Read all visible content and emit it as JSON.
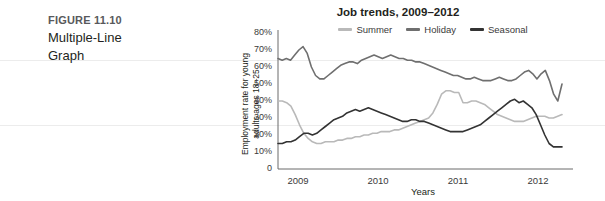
{
  "figure": {
    "number": "FIGURE 11.10",
    "title_line1": "Multiple-Line",
    "title_line2": "Graph"
  },
  "chart_data": {
    "type": "line",
    "title": "Job trends, 2009–2012",
    "xlabel": "Years",
    "ylabel_line1": "Employment rate for young",
    "ylabel_line2": "adults ages 18–25",
    "ylim": [
      0,
      80
    ],
    "ytick_labels": [
      "80%",
      "70%",
      "60%",
      "50%",
      "40%",
      "30%",
      "20%",
      "10%",
      "0"
    ],
    "ytick_values": [
      80,
      70,
      60,
      50,
      40,
      30,
      20,
      10,
      0
    ],
    "xtick_labels": [
      "2009",
      "2010",
      "2011",
      "2012"
    ],
    "xtick_values": [
      2009,
      2010,
      2011,
      2012
    ],
    "xlim": [
      2008.75,
      2012.3
    ],
    "grid": false,
    "legend_position": "top-center",
    "colors": {
      "summer": "#b9b9b9",
      "holiday": "#6f6f6f",
      "seasonal": "#333333",
      "axis": "#6a6a6a",
      "text": "#231f20"
    },
    "series": [
      {
        "name": "Summer",
        "color": "#b9b9b9",
        "values": [
          40,
          40,
          39,
          37,
          32,
          26,
          21,
          18,
          16,
          15,
          15,
          16,
          16,
          16,
          17,
          17,
          18,
          18,
          19,
          19,
          20,
          20,
          21,
          21,
          22,
          22,
          22,
          23,
          23,
          24,
          25,
          26,
          27,
          28,
          29,
          30,
          33,
          38,
          44,
          46,
          46,
          45,
          45,
          39,
          39,
          40,
          40,
          39,
          38,
          36,
          34,
          32,
          31,
          30,
          29,
          28,
          28,
          28,
          29,
          30,
          31,
          31,
          31,
          30,
          30,
          31,
          32
        ]
      },
      {
        "name": "Holiday",
        "color": "#6f6f6f",
        "values": [
          65,
          64,
          65,
          64,
          67,
          70,
          72,
          68,
          60,
          55,
          53,
          53,
          55,
          57,
          59,
          61,
          62,
          63,
          63,
          62,
          64,
          65,
          66,
          67,
          66,
          65,
          66,
          67,
          66,
          65,
          65,
          64,
          64,
          63,
          63,
          62,
          61,
          60,
          59,
          58,
          57,
          56,
          55,
          55,
          54,
          53,
          53,
          54,
          53,
          52,
          52,
          52,
          53,
          54,
          53,
          52,
          52,
          53,
          55,
          57,
          58,
          56,
          53,
          56,
          58,
          52,
          44,
          40,
          50
        ]
      },
      {
        "name": "Seasonal",
        "color": "#333333",
        "values": [
          15,
          15,
          16,
          16,
          17,
          19,
          21,
          21,
          20,
          21,
          23,
          25,
          27,
          29,
          30,
          31,
          33,
          34,
          35,
          34,
          35,
          36,
          35,
          34,
          33,
          32,
          31,
          30,
          29,
          28,
          28,
          29,
          29,
          28,
          28,
          27,
          26,
          25,
          24,
          23,
          22,
          22,
          22,
          22,
          23,
          24,
          25,
          26,
          28,
          30,
          32,
          34,
          36,
          38,
          40,
          41,
          39,
          40,
          38,
          36,
          32,
          26,
          20,
          15,
          13,
          13,
          13
        ]
      }
    ]
  }
}
